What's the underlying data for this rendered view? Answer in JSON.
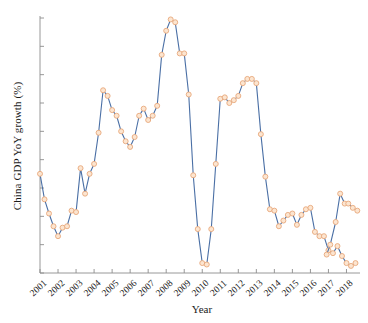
{
  "chart_data": {
    "type": "line",
    "title": "",
    "xlabel": "Year",
    "ylabel": "China GDP YoY growth (%)",
    "ylim": [
      6,
      24
    ],
    "xlim": [
      2001,
      2018.75
    ],
    "yticks": [
      6,
      8,
      10,
      12,
      14,
      16,
      18,
      20,
      22,
      24
    ],
    "xticks": [
      "2001",
      "2002",
      "2003",
      "2004",
      "2005",
      "2006",
      "2007",
      "2008",
      "2009",
      "2010",
      "2011",
      "2012",
      "2013",
      "2014",
      "2015",
      "2016",
      "2017",
      "2018"
    ],
    "grid": false,
    "legend": null,
    "marker": "circle",
    "line_color": "#4a6fa5",
    "marker_face_color": "#fce5d0",
    "marker_edge_color": "#e8a87c",
    "series": [
      {
        "name": "China GDP YoY growth",
        "x": [
          2001.0,
          2001.25,
          2001.5,
          2001.75,
          2002.0,
          2002.25,
          2002.5,
          2002.75,
          2003.0,
          2003.25,
          2003.5,
          2003.75,
          2004.0,
          2004.25,
          2004.5,
          2004.75,
          2005.0,
          2005.25,
          2005.5,
          2005.75,
          2006.0,
          2006.25,
          2006.5,
          2006.75,
          2007.0,
          2007.25,
          2007.5,
          2007.75,
          2008.0,
          2008.25,
          2008.5,
          2008.75,
          2009.0,
          2009.25,
          2009.5,
          2009.75,
          2010.0,
          2010.25,
          2010.5,
          2010.75,
          2011.0,
          2011.25,
          2011.5,
          2011.75,
          2012.0,
          2012.25,
          2012.5,
          2012.75,
          2013.0,
          2013.25,
          2013.5,
          2013.75,
          2014.0,
          2014.25,
          2014.5,
          2014.75,
          2015.0,
          2015.25,
          2015.5,
          2015.75,
          2016.0,
          2016.25,
          2016.5,
          2016.75,
          2017.0,
          2017.25,
          2017.5,
          2017.75,
          2018.0,
          2018.25,
          2018.5
        ],
        "values": [
          13.0,
          11.2,
          10.2,
          9.3,
          8.6,
          9.2,
          9.3,
          10.4,
          10.3,
          13.4,
          11.6,
          13.0,
          13.7,
          15.9,
          18.9,
          18.5,
          17.5,
          17.1,
          16.0,
          15.3,
          14.9,
          15.6,
          17.1,
          17.6,
          16.8,
          17.1,
          17.8,
          21.4,
          23.1,
          23.9,
          23.7,
          21.5,
          21.5,
          18.6,
          12.9,
          9.1,
          6.7,
          6.6,
          9.1,
          13.7,
          18.3,
          18.4,
          18.0,
          18.2,
          18.5,
          19.4,
          19.7,
          19.7,
          19.4,
          15.8,
          12.8,
          10.5,
          10.4,
          9.3,
          9.7,
          10.1,
          10.2,
          9.4,
          10.1,
          10.5,
          10.6,
          8.9,
          8.6,
          8.6,
          7.6,
          7.4,
          7.9,
          7.2,
          6.7,
          6.5,
          6.7
        ]
      },
      {
        "name": "tail",
        "x": [
          2016.9,
          2017.1,
          2017.4,
          2017.65,
          2017.9,
          2018.1,
          2018.35,
          2018.6
        ],
        "values": [
          7.3,
          8.0,
          9.6,
          11.6,
          10.9,
          10.9,
          10.6,
          10.4
        ]
      }
    ]
  }
}
